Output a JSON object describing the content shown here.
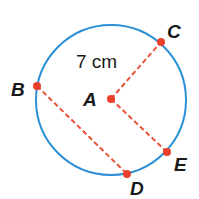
{
  "diagram": {
    "type": "circle",
    "center": "A",
    "measurement_label": "7 cm",
    "colors": {
      "circle": "#2b8fd6",
      "segments": "#e8533a",
      "points": "#e8402a",
      "text": "#1a1a1a"
    },
    "points": [
      {
        "name": "A",
        "label": "A"
      },
      {
        "name": "B",
        "label": "B"
      },
      {
        "name": "C",
        "label": "C"
      },
      {
        "name": "D",
        "label": "D"
      },
      {
        "name": "E",
        "label": "E"
      }
    ],
    "segments": [
      "AC",
      "AE",
      "BD"
    ]
  }
}
